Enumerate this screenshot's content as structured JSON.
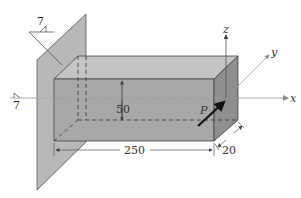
{
  "figure": {
    "type": "engineering-diagram",
    "colors": {
      "plate": "#b8b8b8",
      "front_face": "#a8a8a8",
      "top_face": "#c4c4c4",
      "side_face": "#8e8e8e",
      "line": "#444444",
      "axis": "#aaaaaa"
    },
    "axes": {
      "x_label": "x",
      "y_label": "y",
      "z_label": "z"
    },
    "load": {
      "label": "P"
    },
    "dimensions": {
      "length": "250",
      "height": "50",
      "width": "20"
    },
    "weld_symbols": [
      {
        "size": "7"
      },
      {
        "size": "7"
      }
    ]
  }
}
